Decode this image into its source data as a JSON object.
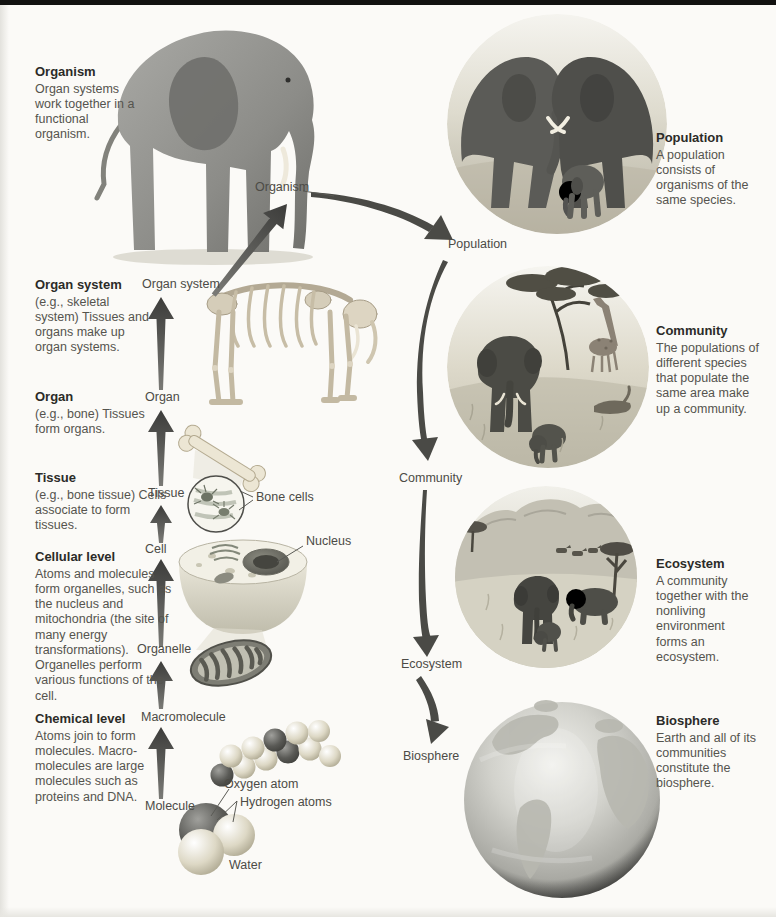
{
  "left_column": {
    "blocks": [
      {
        "heading": "Organism",
        "body": "Organ systems work together in a functional organism."
      },
      {
        "heading": "Organ system",
        "body": "(e.g., skeletal system) Tissues and organs make up organ systems."
      },
      {
        "heading": "Organ",
        "body": "(e.g., bone) Tissues form organs."
      },
      {
        "heading": "Tissue",
        "body": "(e.g., bone tissue) Cells associate to form tissues."
      },
      {
        "heading": "Cellular level",
        "body": "Atoms and molecules form organelles, such as the nucleus and mitochondria (the site of many energy transformations). Organelles perform various functions of the cell."
      },
      {
        "heading": "Chemical level",
        "body": "Atoms join to form molecules. Macro-molecules are large molecules such as proteins and DNA."
      }
    ]
  },
  "right_column": {
    "blocks": [
      {
        "heading": "Population",
        "body": "A population consists of organisms of the same species."
      },
      {
        "heading": "Community",
        "body": "The populations of different species that populate the same area make up a community."
      },
      {
        "heading": "Ecosystem",
        "body": "A community together with the nonliving environment forms an ecosystem."
      },
      {
        "heading": "Biosphere",
        "body": "Earth and all of its communities constitute the biosphere."
      }
    ]
  },
  "ladder_labels": {
    "organism": "Organism",
    "organ_system": "Organ system",
    "organ": "Organ",
    "tissue": "Tissue",
    "cell": "Cell",
    "organelle": "Organelle",
    "macromolecule": "Macromolecule",
    "molecule": "Molecule"
  },
  "scale_labels": {
    "population": "Population",
    "community": "Community",
    "ecosystem": "Ecosystem",
    "biosphere": "Biosphere"
  },
  "callouts": {
    "bone_cells": "Bone cells",
    "nucleus": "Nucleus",
    "oxygen_atom": "Oxygen atom",
    "hydrogen_atoms": "Hydrogen atoms",
    "water": "Water"
  },
  "colors": {
    "arrow": "#4a4a46",
    "heading_text": "#2b2b28",
    "body_text": "#55544e",
    "top_bar": "#121210",
    "page_background": "#fbfaf7"
  }
}
